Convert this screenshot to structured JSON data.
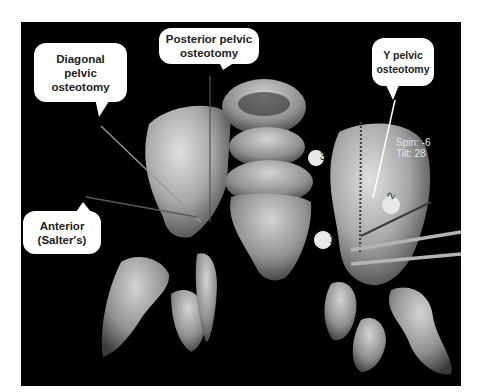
{
  "figure": {
    "callouts": {
      "diagonal": {
        "line1": "Diagonal pelvic",
        "line2": "osteotomy"
      },
      "posterior": {
        "line1": "Posterior pelvic",
        "line2": "osteotomy"
      },
      "y_pelvic": {
        "line1": "Y pelvic",
        "line2": "osteotomy"
      },
      "anterior": {
        "line1": "Anterior",
        "line2": "(Salter's)"
      }
    },
    "viewer_overlay": {
      "spin": "Spin: -6",
      "tilt": "Tilt: 28"
    },
    "markers": [
      "1",
      "2",
      "3"
    ],
    "colors": {
      "background": "#000000",
      "bone": "#b8b8b8",
      "callout_fill": "#ffffff",
      "line": "#8a8a8a"
    }
  }
}
